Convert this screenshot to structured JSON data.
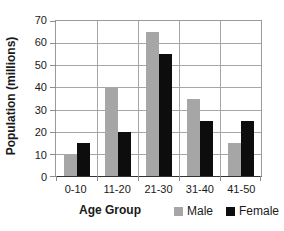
{
  "chart_data": {
    "type": "bar",
    "title": "",
    "xlabel": "Age Group",
    "ylabel": "Population (millions)",
    "categories": [
      "0-10",
      "11-20",
      "21-30",
      "31-40",
      "41-50"
    ],
    "series": [
      {
        "name": "Male",
        "color": "#a6a6a6",
        "values": [
          10,
          40,
          65,
          35,
          15
        ]
      },
      {
        "name": "Female",
        "color": "#0d0d0d",
        "values": [
          15,
          20,
          55,
          25,
          25
        ]
      }
    ],
    "ylim": [
      0,
      70
    ],
    "y_ticks": [
      0,
      10,
      20,
      30,
      40,
      50,
      60,
      70
    ],
    "grid": "both",
    "legend_position": "bottom-right"
  },
  "colors": {
    "gridline": "#a6a6a6",
    "axis_line": "#333333",
    "text": "#1a1a1a",
    "background": "#ffffff"
  }
}
